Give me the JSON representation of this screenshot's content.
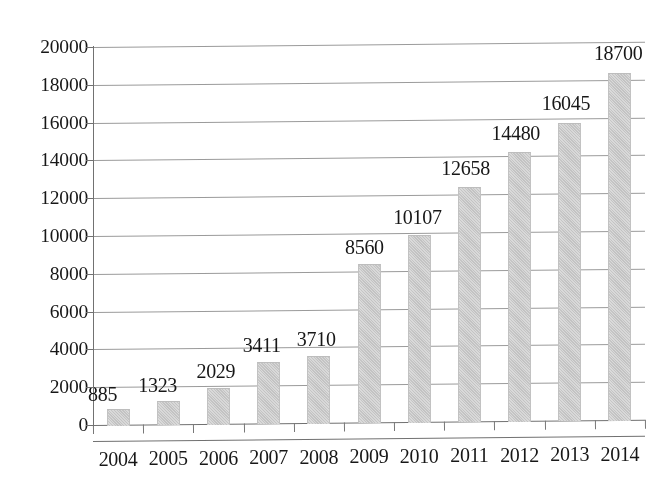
{
  "chart_data": {
    "type": "bar",
    "title": "",
    "subtitle": "",
    "xlabel": "",
    "ylabel": "",
    "categories": [
      "2004",
      "2005",
      "2006",
      "2007",
      "2008",
      "2009",
      "2010",
      "2011",
      "2012",
      "2013",
      "2014"
    ],
    "values": [
      885,
      1323,
      2029,
      3411,
      3710,
      8560,
      10107,
      12658,
      14480,
      16045,
      18700
    ],
    "data_labels": [
      "885",
      "1323",
      "2029",
      "3411",
      "3710",
      "8560",
      "10107",
      "12658",
      "14480",
      "16045",
      "18700"
    ],
    "ylim": [
      0,
      20000
    ],
    "ytick_values": [
      0,
      2000,
      4000,
      6000,
      8000,
      10000,
      12000,
      14000,
      16000,
      18000,
      20000
    ],
    "ytick_labels": [
      "0",
      "2000",
      "4000",
      "6000",
      "8000",
      "10000",
      "12000",
      "14000",
      "16000",
      "18000",
      "20000"
    ],
    "grid": true,
    "grid_axis": "y",
    "legend": null,
    "legend_position": "none",
    "bar_color": "#cccccc",
    "gridline_color": "#9a9a9a",
    "axis_color": "#6f6f6f",
    "text_color": "#141414",
    "background_color": "#ffffff",
    "annotations": []
  }
}
